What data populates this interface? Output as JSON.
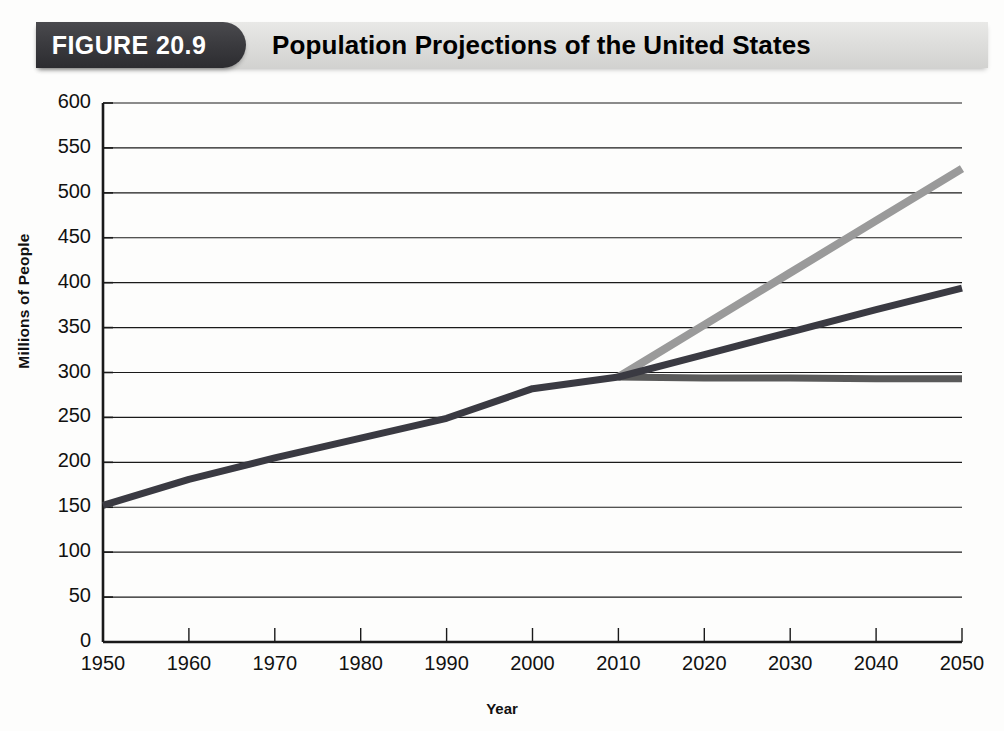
{
  "figure": {
    "number_label": "FIGURE 20.9",
    "title": "Population Projections of the United States",
    "banner_dark_color": "#3a3a3e",
    "banner_light_color": "#dededc"
  },
  "chart_data": {
    "type": "line",
    "title": "Population Projections of the United States",
    "xlabel": "Year",
    "ylabel": "Millions of People",
    "xlim": [
      1950,
      2050
    ],
    "ylim": [
      0,
      600
    ],
    "ytick_step": 50,
    "xtick_step": 10,
    "grid": true,
    "legend": "none",
    "x_tick_labels": [
      "1950",
      "1960",
      "1970",
      "1980",
      "1990",
      "2000",
      "2010",
      "2020",
      "2030",
      "2040",
      "2050"
    ],
    "y_tick_labels": [
      "0",
      "50",
      "100",
      "150",
      "200",
      "250",
      "300",
      "350",
      "400",
      "450",
      "500",
      "550",
      "600"
    ],
    "series": [
      {
        "name": "Historical and middle projection",
        "color": "#3a3a42",
        "width": 7,
        "x": [
          1950,
          1960,
          1970,
          1980,
          1990,
          2000,
          2010,
          2020,
          2030,
          2040,
          2050
        ],
        "values": [
          152,
          181,
          205,
          227,
          249,
          282,
          295,
          320,
          345,
          370,
          394
        ]
      },
      {
        "name": "High projection",
        "color": "#9a9a9a",
        "width": 8,
        "x": [
          2010,
          2020,
          2030,
          2040,
          2050
        ],
        "values": [
          295,
          353,
          411,
          469,
          527
        ]
      },
      {
        "name": "Low projection",
        "color": "#5a5a5a",
        "width": 7,
        "x": [
          2010,
          2020,
          2030,
          2040,
          2050
        ],
        "values": [
          295,
          294,
          294,
          293,
          293
        ]
      }
    ]
  }
}
